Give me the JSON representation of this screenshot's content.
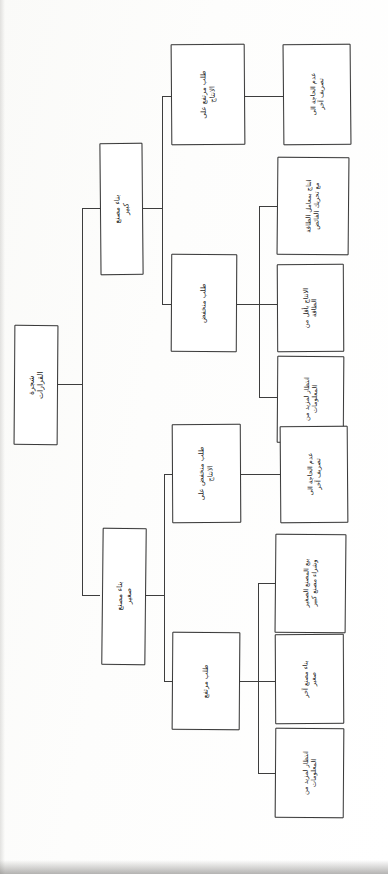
{
  "diagram": {
    "title_node": {
      "id": "root",
      "label": "شجرة القرارات"
    },
    "orientation": "rotated-90",
    "type": "decision-tree",
    "ink_color": "#3a3a3a",
    "paper_color": "#fdfdfd",
    "nodes": [
      {
        "id": "root",
        "level": 1,
        "label": "شجرة القرارات"
      },
      {
        "id": "big-factory",
        "level": 2,
        "label": "بناء مصنع كبير"
      },
      {
        "id": "small-factory",
        "level": 2,
        "label": "بناء مصنع صغير"
      },
      {
        "id": "big-high-demand",
        "level": 3,
        "label": "طلب مرتفع على\nالانتاج"
      },
      {
        "id": "big-low-demand",
        "level": 3,
        "label": "طلب منخفض"
      },
      {
        "id": "small-low-demand",
        "level": 3,
        "label": "طلب منخفض على\nالانتاج"
      },
      {
        "id": "small-high-demand",
        "level": 3,
        "label": "طلب مرتفع"
      },
      {
        "id": "leaf-1",
        "level": 4,
        "parent": "big-high-demand",
        "label": "عدم الحاجة الى\nتصريف آخر"
      },
      {
        "id": "leaf-2",
        "level": 4,
        "parent": "big-low-demand",
        "label": "انتاج بمعامل الطاقة\nمع تحريك الفائض"
      },
      {
        "id": "leaf-3",
        "level": 4,
        "parent": "big-low-demand",
        "label": "الانتاج بأقل من\nالطاقة"
      },
      {
        "id": "leaf-4",
        "level": 4,
        "parent": "big-low-demand",
        "label": "انتظار لمزيد من\nالمعلومات"
      },
      {
        "id": "leaf-5",
        "level": 4,
        "parent": "small-low-demand",
        "label": "عدم الحاجة الى\nتصريف آخر"
      },
      {
        "id": "leaf-6",
        "level": 4,
        "parent": "small-high-demand",
        "label": "بيع المصنع الصغير\nوشراء مصنع كبير"
      },
      {
        "id": "leaf-7",
        "level": 4,
        "parent": "small-high-demand",
        "label": "بناء مصنع آخر\nصغير"
      },
      {
        "id": "leaf-8",
        "level": 4,
        "parent": "small-high-demand",
        "label": "انتظار لمزيد من\nالمعلومات"
      }
    ]
  }
}
